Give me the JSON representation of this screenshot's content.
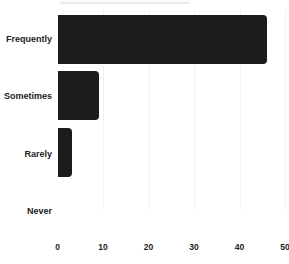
{
  "chart_data": {
    "type": "bar",
    "orientation": "horizontal",
    "title": "",
    "xlabel": "",
    "ylabel": "",
    "categories": [
      "Frequently",
      "Sometimes",
      "Rarely",
      "Never"
    ],
    "values": [
      46,
      9,
      3,
      0
    ],
    "xlim": [
      0,
      50
    ],
    "xticks": [
      "0",
      "10",
      "20",
      "30",
      "40",
      "50"
    ],
    "grid": true,
    "bar_color": "#1c1c1c"
  }
}
